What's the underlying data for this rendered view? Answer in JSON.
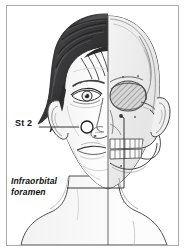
{
  "figure": {
    "kind": "anatomical-illustration",
    "border_color": "#a9a9a9",
    "background_color": "#ffffff",
    "ink_color": "#111111"
  },
  "labels": {
    "acupoint": {
      "text": "St 2",
      "style": "bold",
      "marker": "open-circle"
    },
    "foramen": {
      "line1": "Infraorbital",
      "line2": "foramen",
      "style": "bold-italic",
      "marker": "dot"
    }
  },
  "anatomy": {
    "left_half": "face",
    "right_half": "skull",
    "hair_color": "#3a3a3c",
    "skull_tone": "#ededed",
    "skin_tone": "#fbfbfb",
    "orbit_fill": "hatched"
  }
}
